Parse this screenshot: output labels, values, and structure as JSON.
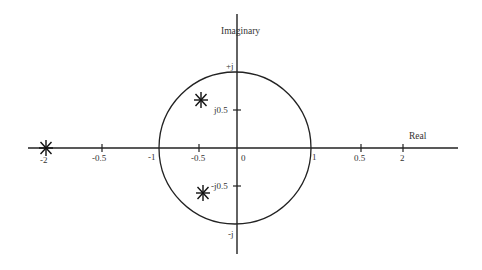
{
  "diagram": {
    "type": "pole-zero plot (complex plane, unit circle)",
    "axes": {
      "real_label": "Real",
      "imaginary_label": "Imaginary"
    },
    "real_ticks": [
      {
        "label": "-2",
        "px": 46
      },
      {
        "label": "-0.5",
        "px": 102
      },
      {
        "label": "-1",
        "px": 159
      },
      {
        "label": "-0.5",
        "px": 199
      },
      {
        "label": "0",
        "px": 237
      },
      {
        "label": "1",
        "px": 310
      },
      {
        "label": "0.5",
        "px": 361
      },
      {
        "label": "2",
        "px": 403
      }
    ],
    "imag_ticks": [
      {
        "label": "+j",
        "py": 72
      },
      {
        "label": "j0.5",
        "py": 110
      },
      {
        "label": "-j0.5",
        "py": 186
      },
      {
        "label": "-j",
        "py": 224
      }
    ],
    "unit_circle": {
      "cx": 235,
      "cy": 148,
      "r": 76
    },
    "markers": [
      {
        "name": "pole-upper",
        "symbol": "*",
        "re": -0.5,
        "im": 0.6,
        "px": 201,
        "py": 100
      },
      {
        "name": "pole-lower",
        "symbol": "*",
        "re": -0.5,
        "im": -0.6,
        "px": 203,
        "py": 193
      },
      {
        "name": "pole-real",
        "symbol": "*",
        "re": -2,
        "im": 0,
        "px": 46,
        "py": 148
      }
    ],
    "colors": {
      "line": "#222222",
      "text": "#333333",
      "background": "#ffffff"
    }
  }
}
